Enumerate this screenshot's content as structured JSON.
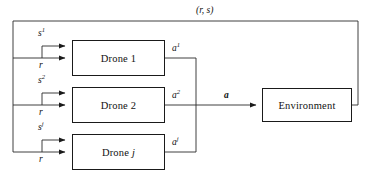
{
  "diagram": {
    "title_label": "(r, s)",
    "nodes": [
      {
        "id": "drone1",
        "label": "Drone",
        "index": "1",
        "x": 72,
        "y": 40,
        "w": 93,
        "h": 36
      },
      {
        "id": "drone2",
        "label": "Drone",
        "index": "2",
        "x": 72,
        "y": 87,
        "w": 93,
        "h": 36
      },
      {
        "id": "dronej",
        "label": "Drone",
        "index": "j",
        "x": 72,
        "y": 134,
        "w": 93,
        "h": 36
      },
      {
        "id": "environment",
        "label": "Environment",
        "index": "",
        "x": 262,
        "y": 88,
        "w": 90,
        "h": 34
      }
    ],
    "input_labels": [
      {
        "name": "state-1",
        "base": "s",
        "sup": "1"
      },
      {
        "name": "reward-1",
        "base": "r",
        "sup": ""
      },
      {
        "name": "state-2",
        "base": "s",
        "sup": "2"
      },
      {
        "name": "reward-2",
        "base": "r",
        "sup": ""
      },
      {
        "name": "state-j",
        "base": "s",
        "sup": "j"
      },
      {
        "name": "reward-j",
        "base": "r",
        "sup": ""
      }
    ],
    "output_labels": [
      {
        "name": "action-1",
        "base": "a",
        "sup": "1"
      },
      {
        "name": "action-2",
        "base": "a",
        "sup": "2"
      },
      {
        "name": "action-j",
        "base": "a",
        "sup": "j"
      }
    ],
    "joint_action_label": "a",
    "colors": {
      "stroke": "#1a1a1a",
      "wire": "#2b2b2b",
      "background": "#ffffff",
      "text": "#111111"
    }
  }
}
